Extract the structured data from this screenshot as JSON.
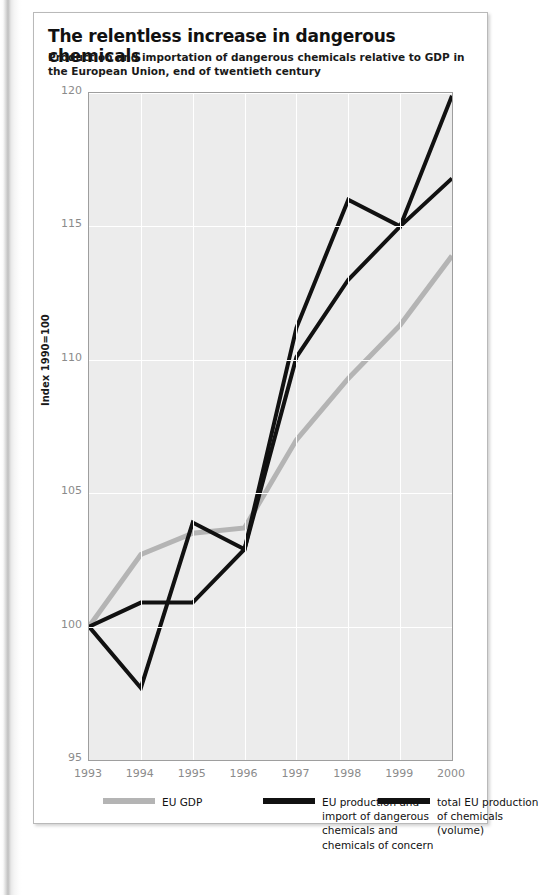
{
  "figure": {
    "title": "The relentless increase in dangerous chemicals",
    "subtitle": "Production and importation of dangerous chemicals relative to GDP in the European Union, end of twentieth century"
  },
  "legend": [
    {
      "label": "EU GDP",
      "color": "#b4b4b4"
    },
    {
      "label": "EU production and import of dangerous chemicals and chemicals of concern",
      "color": "#111111"
    },
    {
      "label": "total EU production of chemicals (volume)",
      "color": "#111111"
    }
  ],
  "chart_data": {
    "type": "line",
    "title": "The relentless increase in dangerous chemicals",
    "subtitle": "Production and importation of dangerous chemicals relative to GDP in the European Union, end of twentieth century",
    "xlabel": "",
    "ylabel": "Index 1990=100",
    "categories": [
      "1993",
      "1994",
      "1995",
      "1996",
      "1997",
      "1998",
      "1999",
      "2000"
    ],
    "x": [
      1993,
      1994,
      1995,
      1996,
      1997,
      1998,
      1999,
      2000
    ],
    "ylim": [
      95,
      120
    ],
    "yticks": [
      95,
      100,
      105,
      110,
      115,
      120
    ],
    "grid": true,
    "legend_position": "bottom",
    "series": [
      {
        "name": "EU GDP",
        "color": "#b4b4b4",
        "width": 5,
        "values": [
          100.0,
          102.7,
          103.5,
          103.7,
          107.0,
          109.3,
          111.3,
          113.9
        ]
      },
      {
        "name": "EU production and import of dangerous chemicals and chemicals of concern",
        "color": "#111111",
        "width": 4,
        "values": [
          100.0,
          100.9,
          100.9,
          102.9,
          110.1,
          113.0,
          115.0,
          116.8
        ]
      },
      {
        "name": "total EU production of chemicals (volume)",
        "color": "#111111",
        "width": 4,
        "values": [
          100.0,
          97.7,
          103.9,
          102.9,
          111.2,
          116.0,
          115.0,
          119.9
        ]
      }
    ]
  }
}
